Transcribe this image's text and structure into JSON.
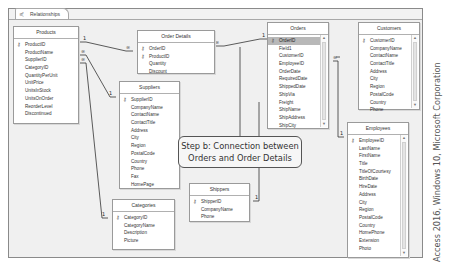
{
  "tab": {
    "label": "Relationships",
    "icon": "relationships-icon"
  },
  "tables": {
    "products": {
      "title": "Products",
      "fields": [
        "ProductID",
        "ProductName",
        "SupplierID",
        "CategoryID",
        "QuantityPerUnit",
        "UnitPrice",
        "UnitsInStock",
        "UnitsOnOrder",
        "ReorderLevel",
        "Discontinued"
      ],
      "keys": [
        "ProductID"
      ]
    },
    "order_details": {
      "title": "Order Details",
      "fields": [
        "OrderID",
        "ProductID",
        "Quantity",
        "Discount"
      ],
      "keys": [
        "OrderID",
        "ProductID"
      ]
    },
    "orders": {
      "title": "Orders",
      "fields": [
        "OrderID",
        "Field1",
        "CustomerID",
        "EmployeeID",
        "OrderDate",
        "RequiredDate",
        "ShippedDate",
        "ShipVia",
        "Freight",
        "ShipName",
        "ShipAddress",
        "ShipCity"
      ],
      "keys": [
        "OrderID"
      ],
      "selected": "OrderID"
    },
    "customers": {
      "title": "Customers",
      "fields": [
        "CustomerID",
        "CompanyName",
        "ContactName",
        "ContactTitle",
        "Address",
        "City",
        "Region",
        "PostalCode",
        "Country",
        "Phone"
      ],
      "keys": [
        "CustomerID"
      ]
    },
    "suppliers": {
      "title": "Suppliers",
      "fields": [
        "SupplierID",
        "CompanyName",
        "ContactName",
        "ContactTitle",
        "Address",
        "City",
        "Region",
        "PostalCode",
        "Country",
        "Phone",
        "Fax",
        "HomePage"
      ],
      "keys": [
        "SupplierID"
      ]
    },
    "employees": {
      "title": "Employees",
      "fields": [
        "EmployeeID",
        "LastName",
        "FirstName",
        "Title",
        "TitleOfCourtesy",
        "BirthDate",
        "HireDate",
        "Address",
        "City",
        "Region",
        "PostalCode",
        "Country",
        "HomePhone",
        "Extension",
        "Photo"
      ],
      "keys": [
        "EmployeeID"
      ]
    },
    "shippers": {
      "title": "Shippers",
      "fields": [
        "ShipperID",
        "CompanyName",
        "Phone"
      ],
      "keys": [
        "ShipperID"
      ]
    },
    "categories": {
      "title": "Categories",
      "fields": [
        "CategoryID",
        "CategoryName",
        "Description",
        "Picture"
      ],
      "keys": [
        "CategoryID"
      ]
    }
  },
  "relationship_symbols": {
    "one": "1",
    "many": "∞"
  },
  "callout": {
    "line1": "Step b: Connection between",
    "line2": "Orders and Order Details"
  },
  "credit": "Access 2016, Windows 10, Microsoft Corporation",
  "colors": {
    "selected_row": "#b8b8b8",
    "canvas": "#f0f0f0",
    "border": "#9a9a9a"
  }
}
